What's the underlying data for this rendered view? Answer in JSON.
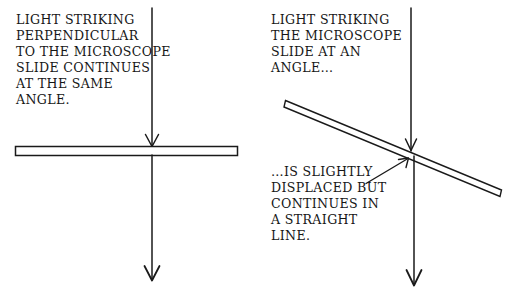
{
  "figure": {
    "background_color": "#ffffff",
    "ink_color": "#1a1a1a",
    "panels": [
      {
        "id": "left",
        "caption": "LIGHT STRIKING\nPERPENDICULAR\nTO THE MICROSCOPE\nSLIDE CONTINUES\nAT THE SAME\nANGLE.",
        "slide": {
          "orientation": "horizontal",
          "x1": 15,
          "y1": 146,
          "x2": 238,
          "y2": 156
        },
        "beam": {
          "incoming": {
            "x1": 152,
            "y1": 8,
            "x2": 152,
            "y2": 146
          },
          "outgoing": {
            "x1": 152,
            "y1": 156,
            "x2": 152,
            "y2": 279
          },
          "displaced": false
        }
      },
      {
        "id": "right",
        "heading": "LIGHT STRIKING\nTHE MICROSCOPE\nSLIDE AT AN\nANGLE…",
        "caption": "…IS SLIGHTLY\nDISPLACED BUT\nCONTINUES IN\nA STRAIGHT\nLINE.",
        "slide": {
          "orientation": "tilted",
          "x1": 285,
          "y1": 100,
          "x2": 502,
          "y2": 190,
          "thickness": 7
        },
        "beam": {
          "incoming": {
            "x1": 411,
            "y1": 8,
            "x2": 411,
            "y2": 150
          },
          "outgoing": {
            "x1": 414,
            "y1": 158,
            "x2": 414,
            "y2": 284
          },
          "displaced": true
        },
        "pointer": {
          "x1": 366,
          "y1": 183,
          "x2": 409,
          "y2": 159
        }
      }
    ]
  }
}
